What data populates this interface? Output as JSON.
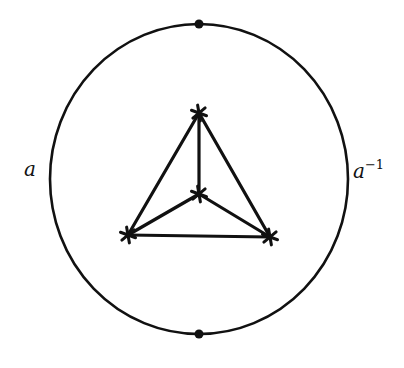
{
  "diagram": {
    "type": "graph-on-disk",
    "colors": {
      "stroke": "#111111",
      "background": "#ffffff"
    },
    "boundary": {
      "shape": "circle",
      "cx": 199,
      "cy": 179,
      "rx": 149,
      "ry": 155,
      "marked_points": [
        {
          "name": "top-point",
          "x": 199,
          "y": 24
        },
        {
          "name": "bottom-point",
          "x": 199,
          "y": 334
        }
      ]
    },
    "labels": {
      "left": {
        "text": "a",
        "x": 24,
        "y": 176
      },
      "right": {
        "base": "a",
        "sup": "−1",
        "x": 353,
        "y": 178
      }
    },
    "vertices": [
      {
        "id": "top",
        "x": 199,
        "y": 113
      },
      {
        "id": "center",
        "x": 199,
        "y": 194
      },
      {
        "id": "bottom-left",
        "x": 128,
        "y": 235
      },
      {
        "id": "bottom-right",
        "x": 270,
        "y": 237
      }
    ],
    "edges": [
      [
        "top",
        "center"
      ],
      [
        "top",
        "bottom-left"
      ],
      [
        "top",
        "bottom-right"
      ],
      [
        "center",
        "bottom-left"
      ],
      [
        "center",
        "bottom-right"
      ],
      [
        "bottom-left",
        "bottom-right"
      ]
    ]
  }
}
